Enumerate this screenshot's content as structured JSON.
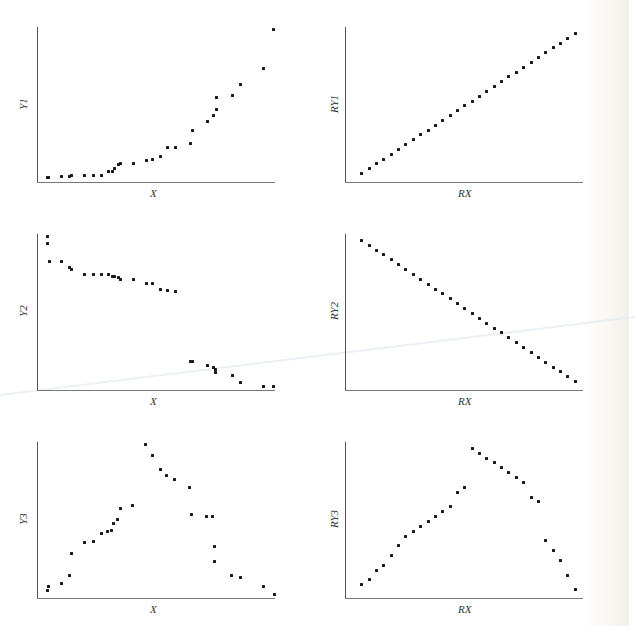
{
  "figure": {
    "panels": [
      {
        "id": "y1-vs-x",
        "xlabel": "X",
        "ylabel": "Y1"
      },
      {
        "id": "ry1-vs-rx",
        "xlabel": "RX",
        "ylabel": "RY1"
      },
      {
        "id": "y2-vs-x",
        "xlabel": "X",
        "ylabel": "Y2"
      },
      {
        "id": "ry2-vs-rx",
        "xlabel": "RX",
        "ylabel": "RY2"
      },
      {
        "id": "y3-vs-x",
        "xlabel": "X",
        "ylabel": "Y3"
      },
      {
        "id": "ry3-vs-rx",
        "xlabel": "RX",
        "ylabel": "RY3"
      }
    ]
  },
  "chart_data": [
    {
      "type": "scatter",
      "title": "",
      "xlabel": "X",
      "ylabel": "Y1",
      "grid": false,
      "legend": null,
      "xlim": [
        0,
        100
      ],
      "ylim": [
        0,
        100
      ],
      "note": "No tick labels shown; values are normalized 0-100 positions within axes",
      "points": [
        [
          4.2,
          3.2
        ],
        [
          4.6,
          3.2
        ],
        [
          10.1,
          3.9
        ],
        [
          13.4,
          3.9
        ],
        [
          14.3,
          4.5
        ],
        [
          19.7,
          4.5
        ],
        [
          23.5,
          4.5
        ],
        [
          26.9,
          4.5
        ],
        [
          29.8,
          7.1
        ],
        [
          31.5,
          7.1
        ],
        [
          32.4,
          9.0
        ],
        [
          34.0,
          11.6
        ],
        [
          34.9,
          12.3
        ],
        [
          40.3,
          12.3
        ],
        [
          45.8,
          14.2
        ],
        [
          48.3,
          14.8
        ],
        [
          51.7,
          16.8
        ],
        [
          54.6,
          22.6
        ],
        [
          58.0,
          22.6
        ],
        [
          64.3,
          25.2
        ],
        [
          65.1,
          33.5
        ],
        [
          71.4,
          39.4
        ],
        [
          73.9,
          43.2
        ],
        [
          75.2,
          47.1
        ],
        [
          75.2,
          54.8
        ],
        [
          81.9,
          56.1
        ],
        [
          85.3,
          63.2
        ],
        [
          95.0,
          73.5
        ],
        [
          99.2,
          98.7
        ]
      ]
    },
    {
      "type": "scatter",
      "title": "",
      "xlabel": "RX",
      "ylabel": "RY1",
      "grid": false,
      "legend": null,
      "xlim": [
        0,
        31
      ],
      "ylim": [
        0,
        31
      ],
      "note": "Ranks of X vs ranks of Y1 (monotonic increasing)",
      "points": [
        [
          1,
          1
        ],
        [
          2,
          2
        ],
        [
          3,
          3
        ],
        [
          4,
          4
        ],
        [
          5,
          5
        ],
        [
          6,
          6
        ],
        [
          7,
          7
        ],
        [
          8,
          8
        ],
        [
          9,
          9
        ],
        [
          10,
          10
        ],
        [
          11,
          11
        ],
        [
          12,
          12
        ],
        [
          13,
          13
        ],
        [
          14,
          14
        ],
        [
          15,
          15
        ],
        [
          16,
          16
        ],
        [
          17,
          17
        ],
        [
          18,
          18
        ],
        [
          19,
          19
        ],
        [
          20,
          20
        ],
        [
          21,
          21
        ],
        [
          22,
          22
        ],
        [
          23,
          23
        ],
        [
          24,
          24
        ],
        [
          25,
          25
        ],
        [
          26,
          26
        ],
        [
          27,
          27
        ],
        [
          28,
          28
        ],
        [
          29,
          29
        ],
        [
          30,
          30
        ]
      ]
    },
    {
      "type": "scatter",
      "title": "",
      "xlabel": "X",
      "ylabel": "Y2",
      "grid": false,
      "legend": null,
      "xlim": [
        0,
        100
      ],
      "ylim": [
        0,
        100
      ],
      "note": "No tick labels shown; values are normalized 0-100 positions within axes",
      "points": [
        [
          4.2,
          98.7
        ],
        [
          4.2,
          94.2
        ],
        [
          5.0,
          82.7
        ],
        [
          10.1,
          82.7
        ],
        [
          13.4,
          78.8
        ],
        [
          14.3,
          77.6
        ],
        [
          19.7,
          74.4
        ],
        [
          23.5,
          74.4
        ],
        [
          26.9,
          74.4
        ],
        [
          29.8,
          74.4
        ],
        [
          31.5,
          73.1
        ],
        [
          32.4,
          73.1
        ],
        [
          34.0,
          72.4
        ],
        [
          34.9,
          71.2
        ],
        [
          40.3,
          71.2
        ],
        [
          45.8,
          68.6
        ],
        [
          48.3,
          68.6
        ],
        [
          51.7,
          64.7
        ],
        [
          54.6,
          64.1
        ],
        [
          58.0,
          63.5
        ],
        [
          64.3,
          18.6
        ],
        [
          65.1,
          18.6
        ],
        [
          71.4,
          16.0
        ],
        [
          73.9,
          14.7
        ],
        [
          74.8,
          13.5
        ],
        [
          74.8,
          11.5
        ],
        [
          81.9,
          9.6
        ],
        [
          85.3,
          5.1
        ],
        [
          95.0,
          2.6
        ],
        [
          99.2,
          2.6
        ]
      ]
    },
    {
      "type": "scatter",
      "title": "",
      "xlabel": "RX",
      "ylabel": "RY2",
      "grid": false,
      "legend": null,
      "xlim": [
        0,
        31
      ],
      "ylim": [
        0,
        31
      ],
      "note": "Ranks of X vs ranks of Y2 (monotonic decreasing)",
      "points": [
        [
          1,
          30
        ],
        [
          2,
          29
        ],
        [
          3,
          28
        ],
        [
          4,
          27
        ],
        [
          5,
          26
        ],
        [
          6,
          25
        ],
        [
          7,
          24
        ],
        [
          8,
          23
        ],
        [
          9,
          22
        ],
        [
          10,
          21
        ],
        [
          11,
          20
        ],
        [
          12,
          19
        ],
        [
          13,
          18
        ],
        [
          14,
          17
        ],
        [
          15,
          16
        ],
        [
          16,
          15
        ],
        [
          17,
          14
        ],
        [
          18,
          13
        ],
        [
          19,
          12
        ],
        [
          20,
          11
        ],
        [
          21,
          10
        ],
        [
          22,
          9
        ],
        [
          23,
          8
        ],
        [
          24,
          7
        ],
        [
          25,
          6
        ],
        [
          26,
          5
        ],
        [
          27,
          4
        ],
        [
          28,
          3
        ],
        [
          29,
          2
        ],
        [
          30,
          1
        ]
      ]
    },
    {
      "type": "scatter",
      "title": "",
      "xlabel": "X",
      "ylabel": "Y3",
      "grid": false,
      "legend": null,
      "xlim": [
        0,
        100
      ],
      "ylim": [
        0,
        100
      ],
      "note": "No tick labels shown; values are normalized 0-100 positions within axes",
      "points": [
        [
          4.2,
          5.1
        ],
        [
          4.6,
          7.7
        ],
        [
          10.1,
          9.6
        ],
        [
          13.4,
          14.7
        ],
        [
          14.3,
          28.8
        ],
        [
          19.7,
          35.9
        ],
        [
          23.5,
          36.5
        ],
        [
          26.9,
          41.7
        ],
        [
          29.4,
          42.9
        ],
        [
          31.1,
          43.6
        ],
        [
          31.9,
          48.1
        ],
        [
          33.6,
          50.6
        ],
        [
          34.9,
          57.7
        ],
        [
          39.9,
          59.6
        ],
        [
          45.4,
          98.7
        ],
        [
          48.3,
          91.7
        ],
        [
          51.7,
          82.7
        ],
        [
          54.2,
          78.8
        ],
        [
          57.6,
          76.3
        ],
        [
          63.9,
          71.2
        ],
        [
          64.7,
          53.8
        ],
        [
          71.0,
          52.6
        ],
        [
          73.5,
          52.6
        ],
        [
          74.4,
          33.3
        ],
        [
          74.4,
          23.7
        ],
        [
          81.5,
          14.7
        ],
        [
          85.3,
          13.5
        ],
        [
          95.0,
          7.7
        ],
        [
          99.6,
          2.6
        ]
      ]
    },
    {
      "type": "scatter",
      "title": "",
      "xlabel": "RX",
      "ylabel": "RY3",
      "grid": false,
      "legend": null,
      "xlim": [
        0,
        31
      ],
      "ylim": [
        0,
        31
      ],
      "note": "Ranks of X vs ranks of Y3 (rises then falls)",
      "points": [
        [
          1,
          2
        ],
        [
          2,
          3
        ],
        [
          3,
          5
        ],
        [
          4,
          6
        ],
        [
          5,
          8
        ],
        [
          6,
          10
        ],
        [
          7,
          12
        ],
        [
          8,
          13
        ],
        [
          9,
          14
        ],
        [
          10,
          15
        ],
        [
          11,
          16
        ],
        [
          12,
          17
        ],
        [
          13,
          18
        ],
        [
          14,
          21
        ],
        [
          15,
          22
        ],
        [
          16,
          30
        ],
        [
          17,
          29
        ],
        [
          18,
          28
        ],
        [
          19,
          27
        ],
        [
          20,
          26
        ],
        [
          21,
          25
        ],
        [
          22,
          24
        ],
        [
          23,
          23
        ],
        [
          24,
          20
        ],
        [
          25,
          19
        ],
        [
          26,
          11
        ],
        [
          27,
          9
        ],
        [
          28,
          7
        ],
        [
          29,
          4
        ],
        [
          30,
          1
        ]
      ]
    }
  ]
}
